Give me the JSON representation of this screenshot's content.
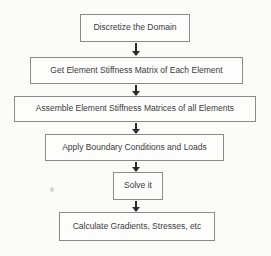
{
  "page": {
    "background_color": "#fbfbf9"
  },
  "flowchart": {
    "description": "Finite element method procedure flowchart",
    "colors": {
      "box_border": "#8a8a8a",
      "box_background": "#fdfdfc",
      "text": "#3b3b3b",
      "arrow": "#2b2b2b"
    },
    "steps": [
      {
        "label": "Discretize the Domain"
      },
      {
        "label": "Get Element Stiffness Matrix of Each Element"
      },
      {
        "label": "Assemble Element Stiffness Matrices of all Elements"
      },
      {
        "label": "Apply Boundary Conditions and Loads"
      },
      {
        "label": "Solve it"
      },
      {
        "label": "Calculate Gradients, Stresses, etc"
      }
    ]
  }
}
